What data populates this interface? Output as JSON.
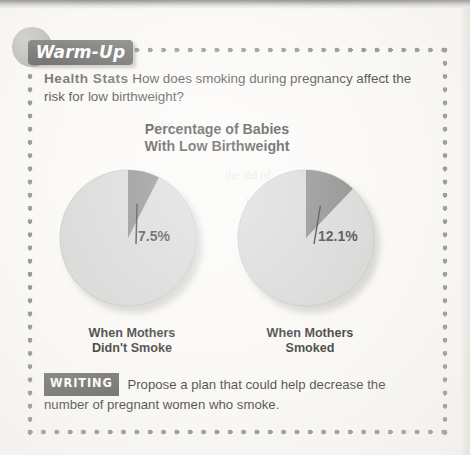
{
  "page": {
    "background_color": "#fbfaf7",
    "frame_dot_color": "#7d7d7d"
  },
  "warmup": {
    "label": "Warm-Up",
    "plate_color": "#575757",
    "text_color": "#ffffff"
  },
  "question": {
    "prompt_label": "Health Stats",
    "prompt_label_color": "#4d4d4d",
    "text": " How does smoking during pregnancy affect the risk for low birthweight?"
  },
  "chart_data": {
    "type": "pie",
    "title": "Percentage of Babies With Low Birthweight",
    "title_line1": "Percentage of Babies",
    "title_line2": "With Low Birthweight",
    "xlabel": "",
    "ylabel": "",
    "legend_position": "none",
    "grid": false,
    "colors": {
      "low_birthweight": "#6b6b6b",
      "normal_birthweight": "#cfcfcf"
    },
    "charts": [
      {
        "caption_line1": "When Mothers",
        "caption_line2": "Didn't Smoke",
        "categories": [
          "Low birthweight",
          "Not low birthweight"
        ],
        "values": [
          7.5,
          92.5
        ],
        "value_label": "7.5%"
      },
      {
        "caption_line1": "When Mothers",
        "caption_line2": "Smoked",
        "categories": [
          "Low birthweight",
          "Not low birthweight"
        ],
        "values": [
          12.1,
          87.9
        ],
        "value_label": "12.1%"
      }
    ]
  },
  "writing": {
    "badge": "WRITING",
    "text": " Propose a plan that could help decrease the number of pregnant women who smoke."
  },
  "bleed_through": [
    {
      "text": "solid",
      "x": 150,
      "y": 118
    },
    {
      "text": "the aid of",
      "x": 225,
      "y": 168
    },
    {
      "text": "before who hold",
      "x": 246,
      "y": 196
    },
    {
      "text": "a cell is",
      "x": 272,
      "y": 218
    },
    {
      "text": "parting one",
      "x": 262,
      "y": 240
    },
    {
      "text": "a water 13",
      "x": 258,
      "y": 262
    },
    {
      "text": "Smoke",
      "x": 120,
      "y": 197
    },
    {
      "text": "Low Weight",
      "x": 70,
      "y": 243
    }
  ]
}
